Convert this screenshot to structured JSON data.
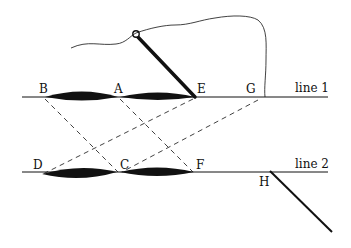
{
  "diagram": {
    "labels": {
      "B": "B",
      "A": "A",
      "E": "E",
      "G": "G",
      "D": "D",
      "C": "C",
      "F": "F",
      "H": "H",
      "line1": "line 1",
      "line2": "line 2"
    },
    "colors": {
      "ink": "#111111",
      "background": "#ffffff"
    }
  }
}
